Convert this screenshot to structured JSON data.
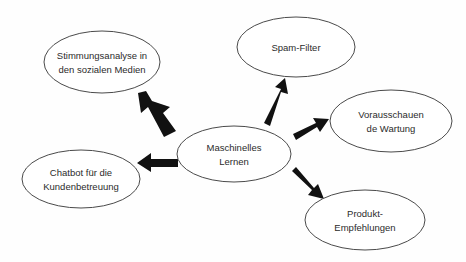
{
  "diagram": {
    "title": "Maschinelles Lernen",
    "background_color": "#fefefe",
    "node_fill": "#ffffff",
    "node_stroke": "#4a4a4a",
    "arrow_color": "#111111",
    "text_color": "#2b2b2b",
    "center": {
      "id": "maschinelles-lernen",
      "line1": "Maschinelles",
      "line2": "Lernen"
    },
    "nodes": [
      {
        "id": "stimmungsanalyse",
        "line1": "Stimmungsanalyse in",
        "line2": "den sozialen Medien"
      },
      {
        "id": "spam-filter",
        "line1": "Spam-Filter",
        "line2": ""
      },
      {
        "id": "vorausschauende-wartung",
        "line1": "Vorausschauen",
        "line2": "de Wartung"
      },
      {
        "id": "produkt-empfehlungen",
        "line1": "Produkt-",
        "line2": "Empfehlungen"
      },
      {
        "id": "chatbot",
        "line1": "Chatbot für die",
        "line2": "Kundenbetreuung"
      }
    ]
  }
}
